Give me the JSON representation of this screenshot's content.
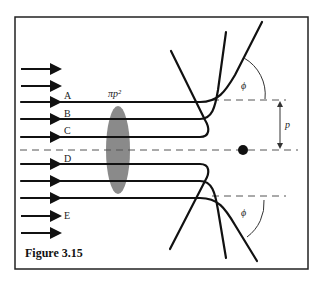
{
  "figure": {
    "caption": "Figure 3.15",
    "area_label": "πp²",
    "impact_parameter_label": "p",
    "angle_label": "ϕ",
    "trajectory_labels": [
      "A",
      "B",
      "C",
      "D",
      "E"
    ]
  },
  "colors": {
    "line": "#111111",
    "dashed": "#555555",
    "ellipse": "#8a8a8a",
    "frame": "#222222"
  }
}
